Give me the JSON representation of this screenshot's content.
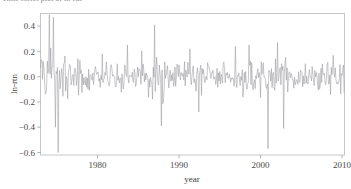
{
  "caption": {
    "text": "Time series plot of ln-rtn"
  },
  "figure": {
    "name": "monthly-log-return-time-series",
    "background": "#ffffff"
  },
  "chart_data": {
    "type": "line",
    "title": "",
    "xlabel": "year",
    "ylabel": "ln-rtn",
    "xlim": [
      1973.0,
      2010.3
    ],
    "ylim": [
      -0.62,
      0.5
    ],
    "xticks": [
      1980,
      1990,
      2000,
      2010
    ],
    "xtick_labels": [
      "1980",
      "1990",
      "2000",
      "2010"
    ],
    "yticks": [
      0.4,
      0.2,
      0.0,
      -0.2,
      -0.4,
      -0.6
    ],
    "ytick_labels": [
      "0.4",
      "0.2",
      "0.0",
      "-0.2",
      "-0.4",
      "-0.6"
    ],
    "grid": false,
    "legend": false,
    "series": [
      {
        "name": "ln-rtn",
        "color": "#9a9aa0",
        "line_width": 0.55,
        "sampling": "monthly",
        "points_per_year": 12,
        "mean": 0.0,
        "description": "Monthly continuously-compounded (log) returns centred near zero with strong volatility clustering.",
        "volatility_regimes": [
          {
            "from": 1973.0,
            "to": 1975.8,
            "sigma": 0.125,
            "note": "very high early volatility"
          },
          {
            "from": 1975.8,
            "to": 1986.4,
            "sigma": 0.058,
            "note": "moderate"
          },
          {
            "from": 1986.4,
            "to": 1988.4,
            "sigma": 0.095,
            "note": "1987 crash cluster"
          },
          {
            "from": 1988.4,
            "to": 1997.0,
            "sigma": 0.055,
            "note": "calm"
          },
          {
            "from": 1997.0,
            "to": 2000.2,
            "sigma": 0.072,
            "note": "late-90s pickup"
          },
          {
            "from": 2000.2,
            "to": 2003.2,
            "sigma": 0.105,
            "note": "dot-com bust cluster"
          },
          {
            "from": 2003.2,
            "to": 2007.4,
            "sigma": 0.05,
            "note": "calm"
          },
          {
            "from": 2007.4,
            "to": 2010.3,
            "sigma": 0.072,
            "note": "late rise in volatility"
          }
        ],
        "notable_extremes": [
          {
            "year": 1974.05,
            "value": 0.49,
            "kind": "max-early-positive"
          },
          {
            "year": 1974.55,
            "value": 0.47,
            "kind": "positive-spike"
          },
          {
            "year": 1974.85,
            "value": -0.4,
            "kind": "negative-spike"
          },
          {
            "year": 1975.15,
            "value": -0.6,
            "kind": "global-minimum"
          },
          {
            "year": 1980.6,
            "value": 0.18,
            "kind": "positive-spike"
          },
          {
            "year": 1983.7,
            "value": 0.25,
            "kind": "positive-spike"
          },
          {
            "year": 1987.0,
            "value": 0.41,
            "kind": "positive-spike"
          },
          {
            "year": 1987.8,
            "value": -0.39,
            "kind": "negative-spike"
          },
          {
            "year": 1991.3,
            "value": 0.22,
            "kind": "positive-spike"
          },
          {
            "year": 1992.4,
            "value": -0.28,
            "kind": "negative-spike"
          },
          {
            "year": 1996.9,
            "value": 0.24,
            "kind": "positive-spike"
          },
          {
            "year": 1998.6,
            "value": 0.25,
            "kind": "positive-spike"
          },
          {
            "year": 2000.9,
            "value": -0.57,
            "kind": "negative-spike"
          },
          {
            "year": 2002.1,
            "value": 0.27,
            "kind": "positive-spike"
          },
          {
            "year": 2002.8,
            "value": -0.41,
            "kind": "negative-spike"
          },
          {
            "year": 2008.9,
            "value": 0.17,
            "kind": "positive-spike"
          }
        ],
        "seed": 20100412
      }
    ]
  },
  "axes_style": {
    "frame_color": "#b9b9bd",
    "tick_color": "#9e9ea4",
    "text_color": "#4a4a4a"
  }
}
